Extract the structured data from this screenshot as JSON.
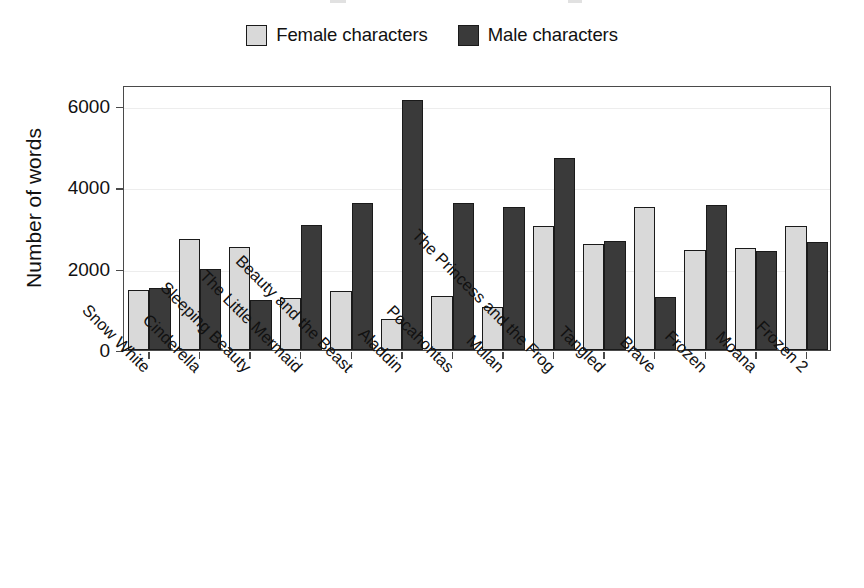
{
  "chart_data": {
    "type": "bar",
    "title": "",
    "xlabel": "",
    "ylabel": "Number of words",
    "ylim": [
      0,
      6500
    ],
    "yticks": [
      0,
      2000,
      4000,
      6000
    ],
    "ytick_labels": [
      "0",
      "2000",
      "4000",
      "6000"
    ],
    "grid": true,
    "legend_position": "top-center",
    "categories": [
      "Snow White",
      "Cinderella",
      "Sleeping Beauty",
      "The Little Mermaid",
      "Beauty and the Beast",
      "Aladdin",
      "Pocahontas",
      "Mulan",
      "The Princess and the Frog",
      "Tangled",
      "Brave",
      "Frozen",
      "Moana",
      "Frozen 2"
    ],
    "series": [
      {
        "name": "Female characters",
        "color": "#d9d9d9",
        "values": [
          1470,
          2720,
          2530,
          1280,
          1460,
          760,
          1330,
          1050,
          3060,
          2620,
          3520,
          2450,
          2500,
          3040
        ]
      },
      {
        "name": "Male characters",
        "color": "#3a3a3a",
        "values": [
          1530,
          1990,
          1220,
          3070,
          3620,
          6150,
          3620,
          3530,
          4730,
          2670,
          1310,
          3570,
          2440,
          2660
        ]
      }
    ]
  },
  "legend": {
    "entries": [
      {
        "label": "Female characters",
        "swatch": "legend-swatch-female"
      },
      {
        "label": "Male characters",
        "swatch": "legend-swatch-male"
      }
    ]
  },
  "axes": {
    "y_axis_title": "Number of words"
  }
}
